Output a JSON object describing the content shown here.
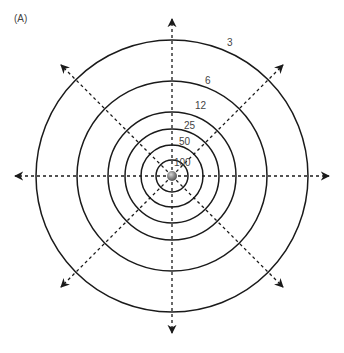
{
  "panel_label": "(A)",
  "diagram": {
    "center": [
      172,
      176
    ],
    "source": {
      "type": "sphere",
      "color": "#8a8a8a"
    },
    "rings": [
      {
        "label": "3",
        "radius": 136,
        "label_pos": [
          227,
          46
        ]
      },
      {
        "label": "6",
        "radius": 95,
        "label_pos": [
          205,
          84
        ]
      },
      {
        "label": "12",
        "radius": 64,
        "label_pos": [
          195,
          109
        ]
      },
      {
        "label": "25",
        "radius": 47,
        "label_pos": [
          184,
          129
        ]
      },
      {
        "label": "50",
        "radius": 31,
        "label_pos": [
          179,
          145
        ]
      },
      {
        "label": "100",
        "radius": 16,
        "label_pos": [
          174,
          166
        ]
      }
    ],
    "rays": {
      "count": 8,
      "length": 157,
      "style": "dashed",
      "arrowheads": true
    },
    "line_color": "#1a1a1a"
  }
}
